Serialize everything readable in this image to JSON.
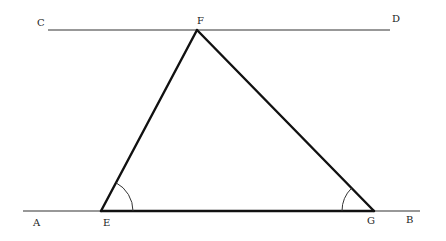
{
  "diagram": {
    "type": "geometry",
    "colors": {
      "stroke": "#111111",
      "thin_stroke": "#333333",
      "background": "#ffffff"
    },
    "points": {
      "A": {
        "label": "A",
        "x": 23,
        "y": 211,
        "lx": 33,
        "ly": 226
      },
      "B": {
        "label": "B",
        "x": 420,
        "y": 211,
        "lx": 406,
        "ly": 223
      },
      "C": {
        "label": "C",
        "x": 48,
        "y": 30,
        "lx": 37,
        "ly": 26
      },
      "D": {
        "label": "D",
        "x": 390,
        "y": 30,
        "lx": 392,
        "ly": 22
      },
      "E": {
        "label": "E",
        "x": 101,
        "y": 211,
        "lx": 103,
        "ly": 226
      },
      "F": {
        "label": "F",
        "x": 197,
        "y": 30,
        "lx": 197,
        "ly": 24
      },
      "G": {
        "label": "G",
        "x": 374,
        "y": 211,
        "lx": 367,
        "ly": 224
      }
    },
    "lines": [
      {
        "name": "line-CD",
        "from": "C",
        "to": "D",
        "weight": "thin"
      },
      {
        "name": "line-AB",
        "from": "A",
        "to": "B",
        "weight": "thin"
      }
    ],
    "triangle": {
      "vertices": [
        "E",
        "F",
        "G"
      ],
      "weight": "thick"
    },
    "angle_marks": [
      {
        "vertex": "E",
        "between": [
          "F",
          "G"
        ],
        "radius": 32
      },
      {
        "vertex": "G",
        "between": [
          "E",
          "F"
        ],
        "radius": 32
      }
    ]
  }
}
